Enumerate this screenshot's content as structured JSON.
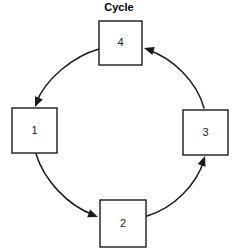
{
  "diagram": {
    "title": "Cycle",
    "title_position": {
      "x": 119,
      "y": 11
    },
    "type": "cycle-flow",
    "background_color": "#ffffff",
    "line_color": "#1a1a1a",
    "box_fill_color": "#ffffff",
    "nodes": [
      {
        "id": "node-4",
        "label": "4",
        "x": 99,
        "y": 21,
        "width": 43,
        "height": 44,
        "center_x": 120.5,
        "center_y": 43,
        "position": "top"
      },
      {
        "id": "node-1",
        "label": "1",
        "x": 12,
        "y": 108,
        "width": 45,
        "height": 45,
        "center_x": 34.5,
        "center_y": 130.5,
        "position": "left"
      },
      {
        "id": "node-2",
        "label": "2",
        "x": 100,
        "y": 200,
        "width": 46,
        "height": 47,
        "center_x": 123,
        "center_y": 223.5,
        "position": "bottom"
      },
      {
        "id": "node-3",
        "label": "3",
        "x": 183,
        "y": 110,
        "width": 45,
        "height": 45,
        "center_x": 205.5,
        "center_y": 132.5,
        "position": "right"
      }
    ],
    "arrows": [
      {
        "id": "arrow-4-to-1",
        "from": "node-4",
        "to": "node-1",
        "path": "M 99 49 C 74 56, 46 78, 36 103",
        "head_x": 35,
        "head_y": 107,
        "head_angle": 113
      },
      {
        "id": "arrow-1-to-2",
        "from": "node-1",
        "to": "node-2",
        "path": "M 36 154 C 44 180, 68 206, 94 215",
        "head_x": 98,
        "head_y": 217,
        "head_angle": 21
      },
      {
        "id": "arrow-2-to-3",
        "from": "node-2",
        "to": "node-3",
        "path": "M 147 216 C 174 208, 197 184, 204 160",
        "head_x": 205,
        "head_y": 156,
        "head_angle": -70
      },
      {
        "id": "arrow-3-to-4",
        "from": "node-3",
        "to": "node-4",
        "path": "M 204 108 C 197 82, 173 58, 148 50",
        "head_x": 144,
        "head_y": 48,
        "head_angle": 197
      }
    ]
  }
}
